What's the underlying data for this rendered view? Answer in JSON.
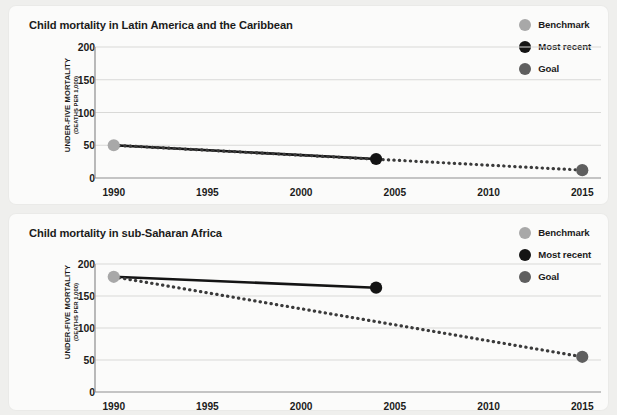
{
  "legend": {
    "items": [
      {
        "label": "Benchmark",
        "icon": "circle-icon",
        "color": "#a8a8a8"
      },
      {
        "label": "Most recent",
        "icon": "circle-icon",
        "color": "#141414"
      },
      {
        "label": "Goal",
        "icon": "circle-icon",
        "color": "#5f5f5f"
      }
    ]
  },
  "axis": {
    "ylabel_main": "UNDER-FIVE MORTALITY",
    "ylabel_sub": "(DEATHS PER 1,000)",
    "yticks": [
      "200",
      "150",
      "100",
      "50",
      "0"
    ],
    "xticks": [
      "1990",
      "1995",
      "2000",
      "2005",
      "2010",
      "2015"
    ]
  },
  "chart_data": [
    {
      "type": "line",
      "title": "Child mortality in Latin America and the Caribbean",
      "xlabel": "",
      "ylabel": "UNDER-FIVE MORTALITY (DEATHS PER 1,000)",
      "xlim": [
        1989,
        2016
      ],
      "ylim": [
        0,
        200
      ],
      "yticks": [
        0,
        50,
        100,
        150,
        200
      ],
      "xticks": [
        1990,
        1995,
        2000,
        2005,
        2010,
        2015
      ],
      "grid": "horizontal",
      "legend_position": "top-right",
      "series": [
        {
          "name": "Most recent",
          "style": "solid",
          "color": "#141414",
          "x": [
            1990,
            2004
          ],
          "values": [
            50,
            29
          ]
        },
        {
          "name": "Goal path",
          "style": "dotted",
          "color": "#3a3a3a",
          "x": [
            1990,
            2015
          ],
          "values": [
            50,
            12
          ]
        }
      ],
      "points": [
        {
          "name": "Benchmark",
          "x": 1990,
          "y": 50,
          "color": "#a8a8a8"
        },
        {
          "name": "Most recent",
          "x": 2004,
          "y": 29,
          "color": "#141414"
        },
        {
          "name": "Goal",
          "x": 2015,
          "y": 12,
          "color": "#5f5f5f"
        }
      ]
    },
    {
      "type": "line",
      "title": "Child mortality in sub-Saharan Africa",
      "xlabel": "",
      "ylabel": "UNDER-FIVE MORTALITY (DEATHS PER 1,000)",
      "xlim": [
        1989,
        2016
      ],
      "ylim": [
        0,
        200
      ],
      "yticks": [
        0,
        50,
        100,
        150,
        200
      ],
      "xticks": [
        1990,
        1995,
        2000,
        2005,
        2010,
        2015
      ],
      "grid": "horizontal",
      "legend_position": "top-right",
      "series": [
        {
          "name": "Most recent",
          "style": "solid",
          "color": "#141414",
          "x": [
            1990,
            2004
          ],
          "values": [
            180,
            163
          ]
        },
        {
          "name": "Goal path",
          "style": "dotted",
          "color": "#3a3a3a",
          "x": [
            1990,
            2015
          ],
          "values": [
            180,
            55
          ]
        }
      ],
      "points": [
        {
          "name": "Benchmark",
          "x": 1990,
          "y": 180,
          "color": "#a8a8a8"
        },
        {
          "name": "Most recent",
          "x": 2004,
          "y": 163,
          "color": "#141414"
        },
        {
          "name": "Goal",
          "x": 2015,
          "y": 55,
          "color": "#5f5f5f"
        }
      ]
    }
  ]
}
